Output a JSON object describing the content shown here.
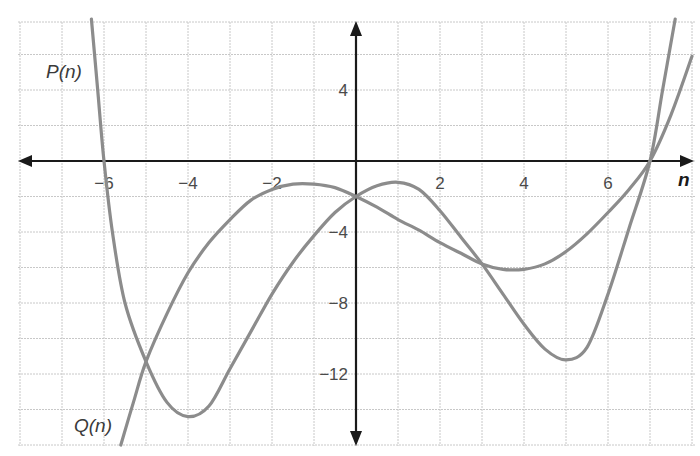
{
  "chart_data": {
    "type": "line",
    "title": "",
    "xlabel": "n",
    "ylabel": "",
    "xlim": [
      -8,
      8
    ],
    "ylim": [
      -16,
      8
    ],
    "grid": true,
    "x_ticks": [
      -6,
      -4,
      -2,
      2,
      4,
      6
    ],
    "y_ticks": [
      4,
      -4,
      -8,
      -12
    ],
    "x_tick_labels": [
      "−6",
      "−4",
      "−2",
      "2",
      "4",
      "6"
    ],
    "y_tick_labels": [
      "4",
      "−4",
      "−8",
      "−12"
    ],
    "grid_x_step": 1,
    "grid_y_step": 2,
    "series": [
      {
        "name": "P(n)",
        "points": [
          [
            -6.3,
            8
          ],
          [
            -6.15,
            4
          ],
          [
            -6,
            0
          ],
          [
            -5.8,
            -4
          ],
          [
            -5.5,
            -8
          ],
          [
            -5,
            -11.3
          ],
          [
            -4.5,
            -13.6
          ],
          [
            -4,
            -14.4
          ],
          [
            -3.5,
            -13.8
          ],
          [
            -3,
            -11.7
          ],
          [
            -2.5,
            -9.6
          ],
          [
            -2,
            -7.5
          ],
          [
            -1.5,
            -5.7
          ],
          [
            -1,
            -4.2
          ],
          [
            -0.5,
            -2.9
          ],
          [
            0,
            -2
          ],
          [
            0.5,
            -1.4
          ],
          [
            1,
            -1.2
          ],
          [
            1.5,
            -1.6
          ],
          [
            2,
            -2.8
          ],
          [
            2.5,
            -4.3
          ],
          [
            3,
            -5.8
          ],
          [
            3.5,
            -7.5
          ],
          [
            4,
            -9.2
          ],
          [
            4.5,
            -10.6
          ],
          [
            5,
            -11.2
          ],
          [
            5.5,
            -10.5
          ],
          [
            6,
            -7.5
          ],
          [
            6.5,
            -3.8
          ],
          [
            7,
            0
          ],
          [
            7.3,
            4
          ],
          [
            7.6,
            8
          ]
        ],
        "label_position": [
          -7.1,
          5.1
        ]
      },
      {
        "name": "Q(n)",
        "points": [
          [
            -5.6,
            -16
          ],
          [
            -5.3,
            -13.6
          ],
          [
            -5,
            -11.3
          ],
          [
            -4.5,
            -8.6
          ],
          [
            -4,
            -6.3
          ],
          [
            -3.5,
            -4.6
          ],
          [
            -3,
            -3.3
          ],
          [
            -2.5,
            -2.2
          ],
          [
            -2,
            -1.6
          ],
          [
            -1.5,
            -1.3
          ],
          [
            -1,
            -1.3
          ],
          [
            -0.5,
            -1.5
          ],
          [
            0,
            -2
          ],
          [
            0.5,
            -2.6
          ],
          [
            1,
            -3.3
          ],
          [
            1.5,
            -3.9
          ],
          [
            2,
            -4.6
          ],
          [
            2.5,
            -5.2
          ],
          [
            3,
            -5.8
          ],
          [
            3.5,
            -6.1
          ],
          [
            4,
            -6.1
          ],
          [
            4.5,
            -5.8
          ],
          [
            5,
            -5.1
          ],
          [
            5.5,
            -4.1
          ],
          [
            6,
            -2.9
          ],
          [
            6.5,
            -1.6
          ],
          [
            7,
            0
          ],
          [
            7.5,
            2.6
          ],
          [
            8,
            5.9
          ]
        ],
        "label_position": [
          -6.5,
          -15.1
        ]
      }
    ],
    "annotations": [
      "Curves intersect at (-5, -11.3), (0, -2), (3, -5.8), (7, 0)"
    ]
  },
  "labels": {
    "p": "P(n)",
    "q": "Q(n)",
    "x_axis": "n"
  },
  "colors": {
    "curve": "#8c8c8c",
    "axis": "#1a1a1a",
    "grid": "#c8c8c8"
  }
}
